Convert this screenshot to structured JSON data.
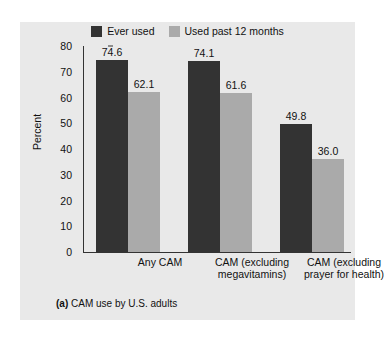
{
  "chart_data": {
    "type": "bar",
    "title": "",
    "caption_tag": "(a)",
    "caption_text": "CAM use by U.S. adults",
    "xlabel": "",
    "ylabel": "Percent",
    "ylim": [
      0,
      80
    ],
    "ytick_labels": [
      "80",
      "70",
      "60",
      "50",
      "40",
      "30",
      "20",
      "10",
      "0"
    ],
    "ytick_values": [
      80,
      70,
      60,
      50,
      40,
      30,
      20,
      10,
      0
    ],
    "grid": false,
    "legend_position": "top-center",
    "categories": [
      "Any CAM",
      "CAM (excluding megavitamins)",
      "CAM (excluding prayer for health)"
    ],
    "category_lines": [
      [
        "Any CAM"
      ],
      [
        "CAM (excluding",
        "megavitamins)"
      ],
      [
        "CAM (excluding",
        "prayer for health)"
      ]
    ],
    "series": [
      {
        "name": "Ever used",
        "color": "#333333",
        "values": [
          74.6,
          74.1,
          49.8
        ],
        "labels": [
          "74.6",
          "74.1",
          "49.8"
        ]
      },
      {
        "name": "Used past 12 months",
        "color": "#aaaaaa",
        "values": [
          62.1,
          61.6,
          36.0
        ],
        "labels": [
          "62.1",
          "61.6",
          "36.0"
        ]
      }
    ]
  },
  "colors": {
    "panel_background": "#e9e9e9",
    "page_background": "#ffffff",
    "axis": "#333333",
    "text": "#111111",
    "series_dark": "#333333",
    "series_light": "#aaaaaa"
  }
}
